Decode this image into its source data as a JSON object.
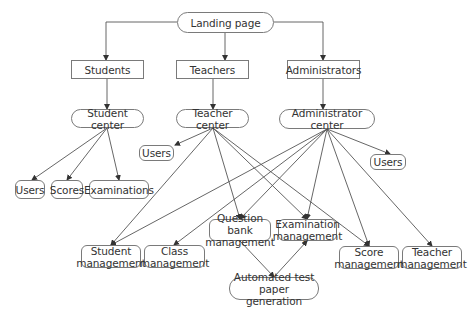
{
  "nodes": {
    "landing": {
      "label": "Landing page",
      "x": 177,
      "y": 12,
      "w": 97,
      "h": 21,
      "shape": "pill"
    },
    "students": {
      "label": "Students",
      "x": 71,
      "y": 60,
      "w": 73,
      "h": 19,
      "shape": "rect"
    },
    "teachers": {
      "label": "Teachers",
      "x": 176,
      "y": 60,
      "w": 73,
      "h": 19,
      "shape": "rect"
    },
    "administrators": {
      "label": "Administrators",
      "x": 287,
      "y": 60,
      "w": 73,
      "h": 19,
      "shape": "rect"
    },
    "student_center": {
      "label": "Student center",
      "x": 71,
      "y": 109,
      "w": 73,
      "h": 19,
      "shape": "pill"
    },
    "teacher_center": {
      "label": "Teacher center",
      "x": 176,
      "y": 109,
      "w": 73,
      "h": 19,
      "shape": "pill"
    },
    "admin_center": {
      "label": "Administrator center",
      "x": 279,
      "y": 109,
      "w": 96,
      "h": 20,
      "shape": "pill"
    },
    "teacher_users": {
      "label": "Users",
      "x": 139,
      "y": 145,
      "w": 35,
      "h": 16,
      "shape": "rounded"
    },
    "admin_users": {
      "label": "Users",
      "x": 370,
      "y": 154,
      "w": 36,
      "h": 16,
      "shape": "rounded"
    },
    "student_users": {
      "label": "Users",
      "x": 15,
      "y": 180,
      "w": 30,
      "h": 19,
      "shape": "rounded"
    },
    "scores": {
      "label": "Scores",
      "x": 51,
      "y": 180,
      "w": 32,
      "h": 19,
      "shape": "rounded"
    },
    "examinations": {
      "label": "Examinations",
      "x": 89,
      "y": 180,
      "w": 60,
      "h": 19,
      "shape": "rounded"
    },
    "student_mgmt": {
      "label": "Student\nmanagement",
      "x": 81,
      "y": 245,
      "w": 60,
      "h": 23,
      "shape": "rounded"
    },
    "class_mgmt": {
      "label": "Class\nmanagement",
      "x": 144,
      "y": 245,
      "w": 61,
      "h": 23,
      "shape": "rounded"
    },
    "question_bank": {
      "label": "Question bank\nmanagement",
      "x": 209,
      "y": 219,
      "w": 62,
      "h": 22,
      "shape": "rounded"
    },
    "exam_mgmt": {
      "label": "Examination\nmanagement",
      "x": 278,
      "y": 219,
      "w": 59,
      "h": 22,
      "shape": "rounded"
    },
    "score_mgmt": {
      "label": "Score\nmanagement",
      "x": 339,
      "y": 246,
      "w": 60,
      "h": 23,
      "shape": "rounded"
    },
    "teacher_mgmt": {
      "label": "Teacher\nmanagement",
      "x": 402,
      "y": 246,
      "w": 60,
      "h": 23,
      "shape": "rounded"
    },
    "auto_paper": {
      "label": "Automated test\npaper generation",
      "x": 229,
      "y": 277,
      "w": 90,
      "h": 23,
      "shape": "pill"
    }
  },
  "edges": [
    {
      "from": [
        177,
        22
      ],
      "via": [
        [
          106,
          22
        ]
      ],
      "to": [
        106,
        60
      ]
    },
    {
      "from": [
        225,
        33
      ],
      "to": [
        225,
        60
      ]
    },
    {
      "from": [
        274,
        22
      ],
      "via": [
        [
          323,
          22
        ]
      ],
      "to": [
        323,
        60
      ]
    },
    {
      "from": [
        107,
        79
      ],
      "to": [
        107,
        109
      ]
    },
    {
      "from": [
        213,
        79
      ],
      "to": [
        213,
        109
      ]
    },
    {
      "from": [
        323,
        79
      ],
      "to": [
        323,
        109
      ]
    },
    {
      "from": [
        107,
        128
      ],
      "to": [
        32,
        180
      ]
    },
    {
      "from": [
        107,
        128
      ],
      "to": [
        67,
        180
      ]
    },
    {
      "from": [
        107,
        128
      ],
      "to": [
        119,
        180
      ]
    },
    {
      "from": [
        213,
        128
      ],
      "to": [
        175,
        145
      ]
    },
    {
      "from": [
        213,
        128
      ],
      "to": [
        111,
        245
      ]
    },
    {
      "from": [
        213,
        128
      ],
      "to": [
        240,
        219
      ]
    },
    {
      "from": [
        213,
        128
      ],
      "to": [
        307,
        219
      ]
    },
    {
      "from": [
        213,
        128
      ],
      "to": [
        369,
        246
      ]
    },
    {
      "from": [
        327,
        129
      ],
      "to": [
        390,
        154
      ]
    },
    {
      "from": [
        327,
        129
      ],
      "to": [
        111,
        245
      ]
    },
    {
      "from": [
        327,
        129
      ],
      "to": [
        174,
        245
      ]
    },
    {
      "from": [
        327,
        129
      ],
      "to": [
        240,
        219
      ]
    },
    {
      "from": [
        327,
        129
      ],
      "to": [
        307,
        219
      ]
    },
    {
      "from": [
        327,
        129
      ],
      "to": [
        369,
        246
      ]
    },
    {
      "from": [
        327,
        129
      ],
      "to": [
        432,
        246
      ]
    },
    {
      "from": [
        240,
        241
      ],
      "to": [
        274,
        277
      ]
    },
    {
      "from": [
        274,
        277
      ],
      "to": [
        307,
        241
      ]
    }
  ],
  "colors": {
    "line": "#555555",
    "border": "#7a7a7a",
    "text": "#333333"
  }
}
